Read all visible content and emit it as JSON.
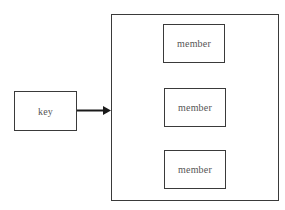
{
  "diagram": {
    "type": "key-to-set",
    "key": {
      "label": "key"
    },
    "container": {
      "members": [
        {
          "label": "member"
        },
        {
          "label": "member"
        },
        {
          "label": "member"
        }
      ]
    },
    "edges": [
      {
        "from": "key",
        "to": "container",
        "style": "solid-arrow"
      }
    ],
    "colors": {
      "stroke": "#3a3a3a",
      "text": "#555555",
      "background": "#ffffff"
    }
  }
}
